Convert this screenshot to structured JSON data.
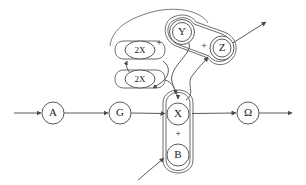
{
  "diagram": {
    "type": "flow-network-diagram",
    "canvas": {
      "width": 306,
      "height": 185
    },
    "background_color": "#ffffff",
    "stroke_color": "#5a5a5a",
    "text_color": "#1a1a1a",
    "nodes": [
      {
        "id": "A",
        "label": "A",
        "shape": "circle",
        "cx": 53,
        "cy": 113,
        "r": 11
      },
      {
        "id": "G",
        "label": "G",
        "shape": "circle",
        "cx": 120,
        "cy": 113,
        "r": 11
      },
      {
        "id": "X",
        "label": "X",
        "shape": "circle",
        "cx": 178,
        "cy": 114,
        "r": 11
      },
      {
        "id": "B",
        "label": "B",
        "shape": "circle",
        "cx": 178,
        "cy": 155,
        "r": 11
      },
      {
        "id": "Omega",
        "label": "Ω",
        "shape": "circle",
        "cx": 248,
        "cy": 113,
        "r": 11
      },
      {
        "id": "Y",
        "label": "Y",
        "shape": "double-circle",
        "cx": 182,
        "cy": 32,
        "r": 11
      },
      {
        "id": "Z",
        "label": "Z",
        "shape": "double-circle",
        "cx": 222,
        "cy": 48,
        "r": 11
      },
      {
        "id": "2X-top",
        "label": "2X",
        "shape": "ellipse",
        "cx": 140,
        "cy": 50,
        "rx": 15,
        "ry": 9
      },
      {
        "id": "2X-bot",
        "label": "2X",
        "shape": "ellipse",
        "cx": 140,
        "cy": 79,
        "rx": 15,
        "ry": 9
      }
    ],
    "operators": [
      {
        "id": "plus-yz-left",
        "label": "+",
        "x": 159,
        "y": 44
      },
      {
        "id": "plus-yz-right",
        "label": "+",
        "x": 204,
        "y": 47
      },
      {
        "id": "plus-xb",
        "label": "+",
        "x": 178,
        "y": 135
      }
    ],
    "groups": [
      {
        "id": "group-xb",
        "members": [
          "X",
          "B"
        ],
        "shape": "vertical-capsule"
      },
      {
        "id": "group-yz",
        "members": [
          "Y",
          "Z"
        ],
        "shape": "tilted-capsule"
      },
      {
        "id": "group-2x",
        "members": [
          "2X-top"
        ],
        "shape": "horizontal-capsule"
      },
      {
        "id": "group-2x-lower",
        "members": [
          "2X-bot"
        ],
        "shape": "horizontal-capsule"
      }
    ],
    "edges": [
      {
        "id": "edge-in-A",
        "from": "input",
        "to": "A",
        "style": "straight-arrow"
      },
      {
        "id": "edge-A-G",
        "from": "A",
        "to": "G",
        "style": "straight-arrow"
      },
      {
        "id": "edge-G-X",
        "from": "G",
        "to": "X",
        "style": "straight-arrow"
      },
      {
        "id": "edge-X-Omega",
        "from": "X",
        "to": "Omega",
        "style": "straight-arrow"
      },
      {
        "id": "edge-Omega-out",
        "from": "Omega",
        "to": "output",
        "style": "straight-arrow"
      },
      {
        "id": "edge-in-B",
        "from": "input",
        "to": "B",
        "style": "diagonal-arrow"
      },
      {
        "id": "edge-Y-X",
        "from": "Y",
        "to": "X",
        "style": "curved-arrow"
      },
      {
        "id": "edge-X-YZ",
        "from": "X",
        "to": "group-yz",
        "style": "curved-arrow"
      },
      {
        "id": "edge-YZ-out",
        "from": "group-yz",
        "to": "output",
        "style": "diagonal-arrow"
      },
      {
        "id": "edge-loop-up",
        "from": "lower",
        "to": "2X-top",
        "style": "curved-arrow"
      },
      {
        "id": "edge-loop-down",
        "from": "2X-top",
        "to": "2X-bot",
        "style": "curved-arrow"
      },
      {
        "id": "edge-2X-bot-X",
        "from": "2X-bot",
        "to": "X",
        "style": "curved-arrow"
      },
      {
        "id": "edge-top-arc",
        "from": "group-yz",
        "to": "group-2x",
        "style": "long-arc"
      }
    ]
  }
}
